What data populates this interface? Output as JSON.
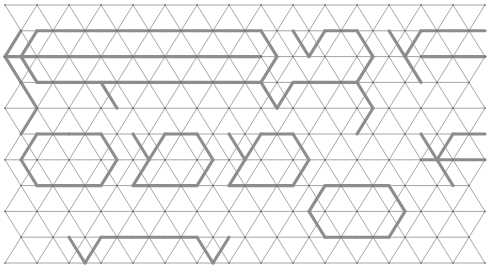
{
  "figure": {
    "name": "triangular-lattice-partition",
    "type": "geometric-lattice-diagram",
    "canvas": {
      "width": 496,
      "height": 270,
      "background": "#ffffff"
    }
  },
  "lattice": {
    "origin_x": 5,
    "origin_y": 5,
    "column_step": 16,
    "row_step": 25.8,
    "columns": 30,
    "rows": 10,
    "triangle_base": 32,
    "thin_edge_color": "#9b9b9b",
    "thin_edge_width": 0.9,
    "thick_edge_color": "#8d8d8d",
    "thick_edge_width": 3.1,
    "node_color": "#6f6f6f",
    "node_radius": 0.85
  },
  "thick_edges": [
    [
      2,
      1,
      4,
      1
    ],
    [
      4,
      1,
      6,
      1
    ],
    [
      6,
      1,
      8,
      1
    ],
    [
      8,
      1,
      10,
      1
    ],
    [
      10,
      1,
      12,
      1
    ],
    [
      12,
      1,
      14,
      1
    ],
    [
      14,
      1,
      16,
      1
    ],
    [
      1,
      1,
      0,
      2
    ],
    [
      0,
      2,
      1,
      3
    ],
    [
      2,
      1,
      1,
      2
    ],
    [
      1,
      2,
      2,
      3
    ],
    [
      0,
      2,
      2,
      2
    ],
    [
      2,
      2,
      4,
      2
    ],
    [
      4,
      2,
      6,
      2
    ],
    [
      6,
      2,
      8,
      2
    ],
    [
      8,
      2,
      10,
      2
    ],
    [
      10,
      2,
      12,
      2
    ],
    [
      12,
      2,
      14,
      2
    ],
    [
      14,
      2,
      16,
      2
    ],
    [
      16,
      1,
      17,
      2
    ],
    [
      17,
      2,
      16,
      3
    ],
    [
      2,
      3,
      4,
      3
    ],
    [
      4,
      3,
      6,
      3
    ],
    [
      6,
      3,
      8,
      3
    ],
    [
      8,
      3,
      10,
      3
    ],
    [
      10,
      3,
      12,
      3
    ],
    [
      12,
      3,
      14,
      3
    ],
    [
      14,
      3,
      16,
      3
    ],
    [
      16,
      3,
      17,
      4
    ],
    [
      17,
      4,
      18,
      3
    ],
    [
      18,
      1,
      19,
      2
    ],
    [
      19,
      2,
      20,
      1
    ],
    [
      20,
      1,
      22,
      1
    ],
    [
      22,
      1,
      23,
      2
    ],
    [
      23,
      2,
      22,
      3
    ],
    [
      18,
      3,
      20,
      3
    ],
    [
      20,
      3,
      22,
      3
    ],
    [
      24,
      1,
      25,
      2
    ],
    [
      25,
      2,
      26,
      1
    ],
    [
      26,
      1,
      28,
      1
    ],
    [
      28,
      1,
      30,
      1
    ],
    [
      26,
      2,
      28,
      2
    ],
    [
      28,
      2,
      30,
      2
    ],
    [
      25,
      2,
      26,
      3
    ],
    [
      2,
      5,
      1,
      6
    ],
    [
      1,
      6,
      2,
      7
    ],
    [
      2,
      5,
      4,
      5
    ],
    [
      4,
      5,
      6,
      5
    ],
    [
      6,
      5,
      7,
      6
    ],
    [
      7,
      6,
      6,
      7
    ],
    [
      2,
      7,
      4,
      7
    ],
    [
      4,
      7,
      6,
      7
    ],
    [
      8,
      5,
      9,
      6
    ],
    [
      9,
      6,
      10,
      5
    ],
    [
      10,
      5,
      12,
      5
    ],
    [
      12,
      5,
      13,
      6
    ],
    [
      13,
      6,
      12,
      7
    ],
    [
      8,
      7,
      10,
      7
    ],
    [
      10,
      7,
      12,
      7
    ],
    [
      9,
      6,
      8,
      7
    ],
    [
      14,
      5,
      15,
      6
    ],
    [
      15,
      6,
      16,
      5
    ],
    [
      16,
      5,
      18,
      5
    ],
    [
      18,
      5,
      19,
      6
    ],
    [
      19,
      6,
      18,
      7
    ],
    [
      14,
      7,
      16,
      7
    ],
    [
      16,
      7,
      18,
      7
    ],
    [
      15,
      6,
      14,
      7
    ],
    [
      20,
      7,
      22,
      7
    ],
    [
      22,
      7,
      24,
      7
    ],
    [
      24,
      7,
      25,
      8
    ],
    [
      25,
      8,
      24,
      9
    ],
    [
      20,
      7,
      19,
      8
    ],
    [
      19,
      8,
      20,
      9
    ],
    [
      20,
      9,
      22,
      9
    ],
    [
      22,
      9,
      24,
      9
    ],
    [
      26,
      5,
      27,
      6
    ],
    [
      27,
      6,
      28,
      5
    ],
    [
      28,
      5,
      30,
      5
    ],
    [
      26,
      6,
      28,
      6
    ],
    [
      28,
      6,
      30,
      6
    ],
    [
      27,
      6,
      28,
      7
    ],
    [
      1,
      3,
      2,
      4
    ],
    [
      2,
      4,
      1,
      5
    ],
    [
      6,
      3,
      7,
      4
    ],
    [
      22,
      3,
      23,
      4
    ],
    [
      23,
      4,
      22,
      5
    ],
    [
      4,
      9,
      5,
      10
    ],
    [
      5,
      10,
      6,
      9
    ],
    [
      12,
      9,
      13,
      10
    ],
    [
      13,
      10,
      14,
      9
    ],
    [
      6,
      9,
      8,
      9
    ],
    [
      8,
      9,
      10,
      9
    ],
    [
      10,
      9,
      12,
      9
    ]
  ],
  "accessibility": {
    "alt_text": "Isometric triangular grid with a subset of edges drawn in a heavier gray stroke, forming hexagonal and chevron shaped outlines scattered across the field"
  }
}
